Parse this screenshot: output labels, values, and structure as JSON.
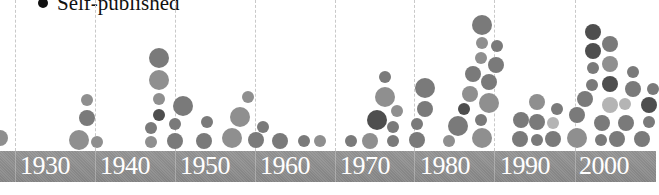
{
  "chart_data": {
    "type": "scatter",
    "subtype": "bubble-timeline",
    "title": "",
    "legend": [
      {
        "label": "Self-published",
        "color": "#111111",
        "marker": "filled-circle"
      }
    ],
    "xlabel": "",
    "ylabel": "",
    "x_ticks": [
      "1930",
      "1940",
      "1950",
      "1960",
      "1970",
      "1980",
      "1990",
      "2000"
    ],
    "grid": {
      "vertical_dashed": true
    },
    "shades": {
      "light": "#b4b4b4",
      "mid": "#8f8f8f",
      "midDark": "#7a7a7a",
      "dark": "#4e4e4e"
    },
    "bubbles": [
      {
        "x": 0,
        "y": 138,
        "r": 8,
        "shade": "mid"
      },
      {
        "x": 79,
        "y": 140,
        "r": 10,
        "shade": "mid"
      },
      {
        "x": 87,
        "y": 118,
        "r": 8,
        "shade": "midDark"
      },
      {
        "x": 87,
        "y": 100,
        "r": 6,
        "shade": "mid"
      },
      {
        "x": 97,
        "y": 142,
        "r": 6,
        "shade": "mid"
      },
      {
        "x": 159,
        "y": 58,
        "r": 10,
        "shade": "midDark"
      },
      {
        "x": 159,
        "y": 80,
        "r": 10,
        "shade": "mid"
      },
      {
        "x": 159,
        "y": 99,
        "r": 6,
        "shade": "mid"
      },
      {
        "x": 159,
        "y": 115,
        "r": 6,
        "shade": "dark"
      },
      {
        "x": 151,
        "y": 128,
        "r": 6,
        "shade": "midDark"
      },
      {
        "x": 151,
        "y": 142,
        "r": 6,
        "shade": "mid"
      },
      {
        "x": 183,
        "y": 106,
        "r": 10,
        "shade": "midDark"
      },
      {
        "x": 175,
        "y": 124,
        "r": 6,
        "shade": "midDark"
      },
      {
        "x": 175,
        "y": 141,
        "r": 8,
        "shade": "midDark"
      },
      {
        "x": 207,
        "y": 122,
        "r": 6,
        "shade": "midDark"
      },
      {
        "x": 204,
        "y": 141,
        "r": 8,
        "shade": "midDark"
      },
      {
        "x": 232,
        "y": 138,
        "r": 10,
        "shade": "mid"
      },
      {
        "x": 240,
        "y": 117,
        "r": 10,
        "shade": "mid"
      },
      {
        "x": 248,
        "y": 97,
        "r": 6,
        "shade": "mid"
      },
      {
        "x": 256,
        "y": 140,
        "r": 8,
        "shade": "midDark"
      },
      {
        "x": 263,
        "y": 127,
        "r": 6,
        "shade": "midDark"
      },
      {
        "x": 280,
        "y": 141,
        "r": 8,
        "shade": "midDark"
      },
      {
        "x": 304,
        "y": 141,
        "r": 6,
        "shade": "midDark"
      },
      {
        "x": 320,
        "y": 141,
        "r": 6,
        "shade": "mid"
      },
      {
        "x": 351,
        "y": 141,
        "r": 6,
        "shade": "midDark"
      },
      {
        "x": 370,
        "y": 141,
        "r": 8,
        "shade": "mid"
      },
      {
        "x": 377,
        "y": 120,
        "r": 10,
        "shade": "dark"
      },
      {
        "x": 385,
        "y": 97,
        "r": 10,
        "shade": "mid"
      },
      {
        "x": 385,
        "y": 77,
        "r": 6,
        "shade": "midDark"
      },
      {
        "x": 397,
        "y": 111,
        "r": 6,
        "shade": "mid"
      },
      {
        "x": 393,
        "y": 127,
        "r": 6,
        "shade": "midDark"
      },
      {
        "x": 393,
        "y": 141,
        "r": 6,
        "shade": "midDark"
      },
      {
        "x": 417,
        "y": 140,
        "r": 8,
        "shade": "midDark"
      },
      {
        "x": 417,
        "y": 124,
        "r": 6,
        "shade": "midDark"
      },
      {
        "x": 425,
        "y": 109,
        "r": 8,
        "shade": "midDark"
      },
      {
        "x": 425,
        "y": 88,
        "r": 10,
        "shade": "midDark"
      },
      {
        "x": 449,
        "y": 141,
        "r": 6,
        "shade": "mid"
      },
      {
        "x": 458,
        "y": 126,
        "r": 10,
        "shade": "midDark"
      },
      {
        "x": 464,
        "y": 109,
        "r": 6,
        "shade": "dark"
      },
      {
        "x": 470,
        "y": 94,
        "r": 8,
        "shade": "mid"
      },
      {
        "x": 473,
        "y": 74,
        "r": 8,
        "shade": "midDark"
      },
      {
        "x": 481,
        "y": 58,
        "r": 6,
        "shade": "mid"
      },
      {
        "x": 482,
        "y": 43,
        "r": 6,
        "shade": "mid"
      },
      {
        "x": 482,
        "y": 25,
        "r": 10,
        "shade": "midDark"
      },
      {
        "x": 497,
        "y": 46,
        "r": 6,
        "shade": "midDark"
      },
      {
        "x": 496,
        "y": 65,
        "r": 8,
        "shade": "midDark"
      },
      {
        "x": 489,
        "y": 82,
        "r": 8,
        "shade": "midDark"
      },
      {
        "x": 489,
        "y": 103,
        "r": 10,
        "shade": "mid"
      },
      {
        "x": 481,
        "y": 120,
        "r": 6,
        "shade": "midDark"
      },
      {
        "x": 482,
        "y": 138,
        "r": 10,
        "shade": "mid"
      },
      {
        "x": 521,
        "y": 120,
        "r": 8,
        "shade": "midDark"
      },
      {
        "x": 520,
        "y": 139,
        "r": 8,
        "shade": "midDark"
      },
      {
        "x": 537,
        "y": 102,
        "r": 8,
        "shade": "mid"
      },
      {
        "x": 537,
        "y": 122,
        "r": 8,
        "shade": "midDark"
      },
      {
        "x": 537,
        "y": 140,
        "r": 6,
        "shade": "midDark"
      },
      {
        "x": 553,
        "y": 123,
        "r": 6,
        "shade": "light"
      },
      {
        "x": 553,
        "y": 139,
        "r": 8,
        "shade": "midDark"
      },
      {
        "x": 557,
        "y": 109,
        "r": 6,
        "shade": "midDark"
      },
      {
        "x": 577,
        "y": 115,
        "r": 8,
        "shade": "midDark"
      },
      {
        "x": 577,
        "y": 138,
        "r": 10,
        "shade": "mid"
      },
      {
        "x": 585,
        "y": 99,
        "r": 8,
        "shade": "midDark"
      },
      {
        "x": 593,
        "y": 32,
        "r": 8,
        "shade": "dark"
      },
      {
        "x": 593,
        "y": 51,
        "r": 8,
        "shade": "dark"
      },
      {
        "x": 593,
        "y": 68,
        "r": 6,
        "shade": "midDark"
      },
      {
        "x": 592,
        "y": 85,
        "r": 6,
        "shade": "midDark"
      },
      {
        "x": 610,
        "y": 44,
        "r": 8,
        "shade": "midDark"
      },
      {
        "x": 610,
        "y": 64,
        "r": 8,
        "shade": "mid"
      },
      {
        "x": 610,
        "y": 84,
        "r": 8,
        "shade": "dark"
      },
      {
        "x": 610,
        "y": 105,
        "r": 8,
        "shade": "light"
      },
      {
        "x": 602,
        "y": 123,
        "r": 8,
        "shade": "midDark"
      },
      {
        "x": 601,
        "y": 140,
        "r": 6,
        "shade": "midDark"
      },
      {
        "x": 617,
        "y": 139,
        "r": 8,
        "shade": "midDark"
      },
      {
        "x": 625,
        "y": 104,
        "r": 6,
        "shade": "light"
      },
      {
        "x": 626,
        "y": 123,
        "r": 8,
        "shade": "midDark"
      },
      {
        "x": 633,
        "y": 72,
        "r": 6,
        "shade": "midDark"
      },
      {
        "x": 633,
        "y": 89,
        "r": 8,
        "shade": "midDark"
      },
      {
        "x": 642,
        "y": 139,
        "r": 8,
        "shade": "midDark"
      },
      {
        "x": 649,
        "y": 122,
        "r": 6,
        "shade": "midDark"
      },
      {
        "x": 649,
        "y": 105,
        "r": 8,
        "shade": "dark"
      },
      {
        "x": 653,
        "y": 89,
        "r": 6,
        "shade": "midDark"
      }
    ]
  },
  "legend": {
    "label": "Self-published"
  },
  "axis": {
    "decades": [
      {
        "label": "1930",
        "x": 20,
        "grid_x": 15
      },
      {
        "label": "1940",
        "x": 100,
        "grid_x": 95
      },
      {
        "label": "1950",
        "x": 180,
        "grid_x": 175
      },
      {
        "label": "1960",
        "x": 260,
        "grid_x": 255
      },
      {
        "label": "1970",
        "x": 340,
        "grid_x": 335
      },
      {
        "label": "1980",
        "x": 420,
        "grid_x": 414
      },
      {
        "label": "1990",
        "x": 500,
        "grid_x": 494
      },
      {
        "label": "2000",
        "x": 579,
        "grid_x": 575
      }
    ]
  }
}
